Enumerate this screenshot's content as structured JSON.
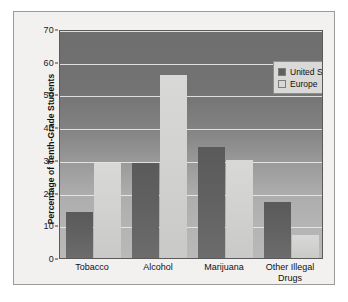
{
  "chart_data": {
    "type": "bar",
    "title": "",
    "xlabel": "",
    "ylabel": "Percentage of Tenth-Grade Students",
    "ylim": [
      0,
      70
    ],
    "ytick_step": 10,
    "yticks": [
      0,
      10,
      20,
      30,
      40,
      50,
      60,
      70
    ],
    "grid": "horizontal",
    "legend_position": "top-right",
    "categories": [
      "Tobacco",
      "Alcohol",
      "Marijuana",
      "Other Illegal\nDrugs"
    ],
    "series": [
      {
        "name": "United States",
        "color": "#606060",
        "values": [
          14,
          29,
          34,
          17
        ]
      },
      {
        "name": "Europe",
        "color": "#d2d2d0",
        "values": [
          29,
          56,
          30,
          7
        ]
      }
    ]
  },
  "legend": {
    "items": [
      {
        "label": "United States"
      },
      {
        "label": "Europe"
      }
    ]
  },
  "axes": {
    "y_title": "Percentage of Tenth-Grade Students",
    "y_tick_labels": [
      "70",
      "60",
      "50",
      "40",
      "30",
      "20",
      "10",
      "0"
    ],
    "x_tick_labels": [
      "Tobacco",
      "Alcohol",
      "Marijuana",
      "Other Illegal\nDrugs"
    ]
  },
  "colors": {
    "series_us": "#606060",
    "series_eu": "#d2d2d0",
    "gridline": "#e8e8e8",
    "frame": "#9a9a9a",
    "page": "#ffffff",
    "figure_bg": "#f2f1ef"
  }
}
